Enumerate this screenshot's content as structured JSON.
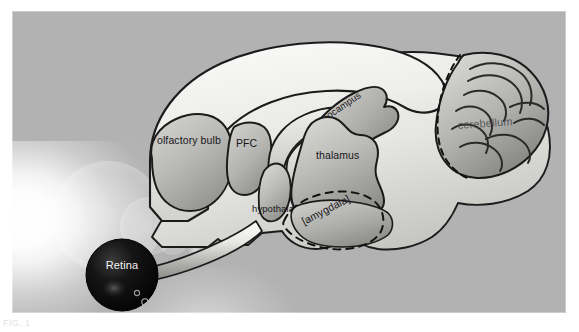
{
  "figure": {
    "background_color": "#b2b2b2",
    "cortex_color": "#efefec",
    "subcortex_color": "#b9b9b6",
    "outline_color": "#1b1b1b",
    "retina_color": "#0b0b0b",
    "caption_text": "FIG. 1"
  },
  "labels": {
    "olfactory_bulb": "olfactory bulb",
    "pfc": "PFC",
    "hippocampus": "hippocampus",
    "thalamus": "thalamus",
    "hypothalamus": "hypothalamus",
    "amygdala": "[amygdala]",
    "cerebellum": "cerebellum",
    "retina": "Retina"
  },
  "diagram": {
    "type": "sagittal-brain-schematic",
    "structures": [
      {
        "name": "olfactory bulb",
        "label": "olfactory bulb",
        "region": "forebrain",
        "shading": "mid-gray"
      },
      {
        "name": "prefrontal cortex",
        "label": "PFC",
        "region": "forebrain",
        "shading": "mid-gray"
      },
      {
        "name": "cortex",
        "label": "",
        "region": "forebrain",
        "shading": "near-white"
      },
      {
        "name": "hippocampus",
        "label": "hippocampus",
        "region": "limbic",
        "shading": "mid-gray",
        "rotated": true
      },
      {
        "name": "thalamus",
        "label": "thalamus",
        "region": "diencephalon",
        "shading": "mid-gray"
      },
      {
        "name": "hypothalamus",
        "label": "hypothalamus",
        "region": "diencephalon",
        "shading": "mid-gray"
      },
      {
        "name": "amygdala",
        "label": "[amygdala]",
        "region": "limbic",
        "shading": "mid-gray",
        "outline": "dashed",
        "rotated": true
      },
      {
        "name": "cerebellum",
        "label": "cerebellum",
        "region": "hindbrain",
        "shading": "foliated",
        "outline": "dashed"
      },
      {
        "name": "retina",
        "label": "Retina",
        "region": "eye",
        "shading": "black-sphere"
      },
      {
        "name": "optic nerve",
        "label": "",
        "region": "pathway",
        "shading": "light-tube"
      }
    ],
    "annotations": [
      "amygdala is bracketed, indicating inferred / out-of-plane location",
      "dashed outlines mark amygdala and cerebellum boundaries",
      "optic nerve runs from retina sphere to ventral forebrain"
    ]
  }
}
